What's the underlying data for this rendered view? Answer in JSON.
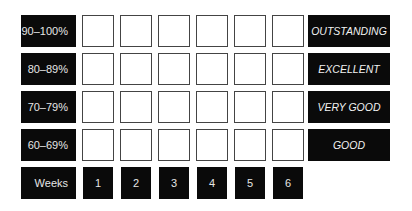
{
  "rows": [
    {
      "range": "90–100%",
      "rating": "OUTSTANDING"
    },
    {
      "range": "80–89%",
      "rating": "EXCELLENT"
    },
    {
      "range": "70–79%",
      "rating": "VERY GOOD"
    },
    {
      "range": "60–69%",
      "rating": "GOOD"
    }
  ],
  "weeks_label": "Weeks",
  "weeks": [
    "1",
    "2",
    "3",
    "4",
    "5",
    "6"
  ],
  "colors": {
    "block": "#0a0a0a",
    "text": "#e6e6e6",
    "box_border": "#444444"
  }
}
